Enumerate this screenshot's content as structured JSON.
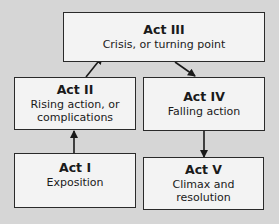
{
  "diagram": {
    "type": "flowchart",
    "colors": {
      "background": "#d6d6d6",
      "box_fill": "#f3f3f3",
      "box_border": "#2a2a2a",
      "arrow": "#1a1a1a"
    },
    "nodes": [
      {
        "id": "act1",
        "title": "Act I",
        "desc_lines": [
          "Exposition"
        ]
      },
      {
        "id": "act2",
        "title": "Act II",
        "desc_lines": [
          "Rising action, or",
          "complications"
        ]
      },
      {
        "id": "act3",
        "title": "Act III",
        "desc_lines": [
          "Crisis, or turning point"
        ]
      },
      {
        "id": "act4",
        "title": "Act IV",
        "desc_lines": [
          "Falling action"
        ]
      },
      {
        "id": "act5",
        "title": "Act V",
        "desc_lines": [
          "Climax and",
          "resolution"
        ]
      }
    ],
    "edges": [
      {
        "from": "act1",
        "to": "act2"
      },
      {
        "from": "act2",
        "to": "act3"
      },
      {
        "from": "act3",
        "to": "act4"
      },
      {
        "from": "act4",
        "to": "act5"
      }
    ]
  }
}
